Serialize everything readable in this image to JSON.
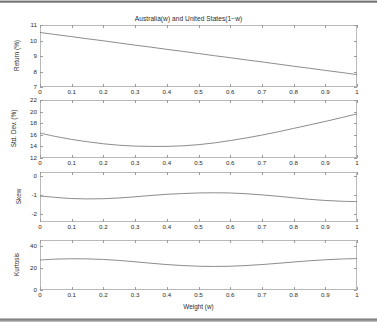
{
  "figure": {
    "title": "Australia(w) and United States(1−w)",
    "xlabel": "Weight (w)",
    "background": "#ffffff",
    "line_color": "#6e6e6e",
    "axis_color": "#b9b9b9",
    "text_color": "#2b2b2b"
  },
  "chart_data": [
    {
      "type": "line",
      "title": "Australia(w) and United States(1−w)",
      "xlabel": "",
      "ylabel": "Return (%)",
      "xlim": [
        0,
        1
      ],
      "ylim": [
        7,
        11
      ],
      "xticks": [
        0,
        0.1,
        0.2,
        0.3,
        0.4,
        0.5,
        0.6,
        0.7,
        0.8,
        0.9,
        1
      ],
      "xticklabels": [
        "0",
        "0.1",
        "0.2",
        "0.3",
        "0.4",
        "0.5",
        "0.6",
        "0.7",
        "0.8",
        "0.9",
        "1"
      ],
      "yticks": [
        7,
        8,
        9,
        10,
        11
      ],
      "yticklabels": [
        "7",
        "8",
        "9",
        "10",
        "11"
      ],
      "grid": false,
      "legend": null,
      "x": [
        0,
        0.05,
        0.1,
        0.15,
        0.2,
        0.25,
        0.3,
        0.35,
        0.4,
        0.45,
        0.5,
        0.55,
        0.6,
        0.65,
        0.7,
        0.75,
        0.8,
        0.85,
        0.9,
        0.95,
        1
      ],
      "values": [
        10.52,
        10.38,
        10.25,
        10.11,
        9.98,
        9.84,
        9.7,
        9.57,
        9.43,
        9.3,
        9.16,
        9.02,
        8.89,
        8.75,
        8.62,
        8.48,
        8.34,
        8.21,
        8.07,
        7.94,
        7.8
      ]
    },
    {
      "type": "line",
      "title": "",
      "xlabel": "",
      "ylabel": "Std. Dev. (%)",
      "xlim": [
        0,
        1
      ],
      "ylim": [
        12,
        22
      ],
      "xticks": [
        0,
        0.1,
        0.2,
        0.3,
        0.4,
        0.5,
        0.6,
        0.7,
        0.8,
        0.9,
        1
      ],
      "xticklabels": [
        "0",
        "0.1",
        "0.2",
        "0.3",
        "0.4",
        "0.5",
        "0.6",
        "0.7",
        "0.8",
        "0.9",
        "1"
      ],
      "yticks": [
        12,
        14,
        16,
        18,
        20,
        22
      ],
      "yticklabels": [
        "12",
        "14",
        "16",
        "18",
        "20",
        "22"
      ],
      "grid": false,
      "legend": null,
      "x": [
        0,
        0.05,
        0.1,
        0.15,
        0.2,
        0.25,
        0.3,
        0.35,
        0.4,
        0.45,
        0.5,
        0.55,
        0.6,
        0.65,
        0.7,
        0.75,
        0.8,
        0.85,
        0.9,
        0.95,
        1
      ],
      "values": [
        16.3,
        15.7,
        15.2,
        14.8,
        14.45,
        14.2,
        14.05,
        14.0,
        14.0,
        14.1,
        14.3,
        14.6,
        15.0,
        15.45,
        15.95,
        16.5,
        17.1,
        17.7,
        18.3,
        18.95,
        19.6
      ]
    },
    {
      "type": "line",
      "title": "",
      "xlabel": "",
      "ylabel": "Skew",
      "xlim": [
        0,
        1
      ],
      "ylim": [
        -2.4,
        0.2
      ],
      "xticks": [
        0,
        0.1,
        0.2,
        0.3,
        0.4,
        0.5,
        0.6,
        0.7,
        0.8,
        0.9,
        1
      ],
      "xticklabels": [
        "0",
        "0.1",
        "0.2",
        "0.3",
        "0.4",
        "0.5",
        "0.6",
        "0.7",
        "0.8",
        "0.9",
        "1"
      ],
      "yticks": [
        0,
        -1,
        -2
      ],
      "yticklabels": [
        "0",
        "-1",
        "-2"
      ],
      "grid": false,
      "legend": null,
      "x": [
        0,
        0.05,
        0.1,
        0.15,
        0.2,
        0.25,
        0.3,
        0.35,
        0.4,
        0.45,
        0.5,
        0.55,
        0.6,
        0.65,
        0.7,
        0.75,
        0.8,
        0.85,
        0.9,
        0.95,
        1
      ],
      "values": [
        -1.05,
        -1.12,
        -1.18,
        -1.2,
        -1.19,
        -1.15,
        -1.09,
        -1.02,
        -0.96,
        -0.92,
        -0.89,
        -0.88,
        -0.89,
        -0.93,
        -0.99,
        -1.06,
        -1.14,
        -1.22,
        -1.28,
        -1.32,
        -1.34
      ]
    },
    {
      "type": "line",
      "title": "",
      "xlabel": "Weight (w)",
      "ylabel": "Kurtosis",
      "xlim": [
        0,
        1
      ],
      "ylim": [
        0,
        45
      ],
      "xticks": [
        0,
        0.1,
        0.2,
        0.3,
        0.4,
        0.5,
        0.6,
        0.7,
        0.8,
        0.9,
        1
      ],
      "xticklabels": [
        "0",
        "0.1",
        "0.2",
        "0.3",
        "0.4",
        "0.5",
        "0.6",
        "0.7",
        "0.8",
        "0.9",
        "1"
      ],
      "yticks": [
        0,
        20,
        40
      ],
      "yticklabels": [
        "0",
        "20",
        "40"
      ],
      "grid": false,
      "legend": null,
      "x": [
        0,
        0.05,
        0.1,
        0.15,
        0.2,
        0.25,
        0.3,
        0.35,
        0.4,
        0.45,
        0.5,
        0.55,
        0.6,
        0.65,
        0.7,
        0.75,
        0.8,
        0.85,
        0.9,
        0.95,
        1
      ],
      "values": [
        27.0,
        27.8,
        28.1,
        28.0,
        27.5,
        26.6,
        25.4,
        24.1,
        22.9,
        22.0,
        21.4,
        21.2,
        21.4,
        22.0,
        22.9,
        24.0,
        25.2,
        26.3,
        27.2,
        27.9,
        28.3
      ]
    }
  ]
}
